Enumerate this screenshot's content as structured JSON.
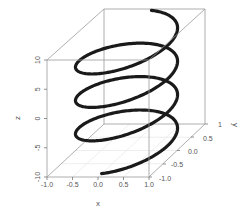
{
  "chart_data": {
    "type": "line3d",
    "title": "",
    "xlabel": "x",
    "ylabel": "y",
    "zlabel": "z",
    "xlim": [
      -1.0,
      1.0
    ],
    "ylim": [
      -1.0,
      1.0
    ],
    "zlim": [
      -10,
      10
    ],
    "x_ticks": [
      "-1.0",
      "-0.5",
      "0.0",
      "0.5",
      "1.0"
    ],
    "y_ticks": [
      "-1.0",
      "-0.5",
      "0.0",
      "0.5",
      "1"
    ],
    "z_ticks": [
      "-10",
      "-5",
      "0",
      "5",
      "10"
    ],
    "grid": true,
    "series": [
      {
        "name": "helix",
        "color": "#1a1a1a",
        "turns": 3.5,
        "t_start": 0,
        "t_end": 21.99,
        "points_sample": [
          {
            "x": 0.0,
            "y": -1.0,
            "z": -10
          },
          {
            "x": -1.0,
            "y": 0.0,
            "z": -8.57
          },
          {
            "x": 0.0,
            "y": 1.0,
            "z": -7.14
          },
          {
            "x": 1.0,
            "y": 0.0,
            "z": -5.71
          },
          {
            "x": 0.0,
            "y": -1.0,
            "z": -4.29
          },
          {
            "x": -1.0,
            "y": 0.0,
            "z": -2.86
          },
          {
            "x": 0.0,
            "y": 1.0,
            "z": -1.43
          },
          {
            "x": 1.0,
            "y": 0.0,
            "z": 0.0
          },
          {
            "x": 0.0,
            "y": -1.0,
            "z": 1.43
          },
          {
            "x": -1.0,
            "y": 0.0,
            "z": 2.86
          },
          {
            "x": 0.0,
            "y": 1.0,
            "z": 4.29
          },
          {
            "x": 1.0,
            "y": 0.0,
            "z": 5.71
          },
          {
            "x": 0.0,
            "y": -1.0,
            "z": 7.14
          },
          {
            "x": -1.0,
            "y": 0.0,
            "z": 8.57
          },
          {
            "x": 0.0,
            "y": 1.0,
            "z": 10.0
          }
        ]
      }
    ]
  },
  "colors": {
    "box": "#9a9a9a",
    "grid": "#dddddd",
    "line": "#1a1a1a",
    "text": "#555555"
  }
}
